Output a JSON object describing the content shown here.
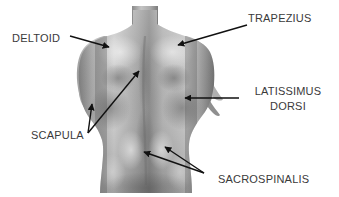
{
  "diagram": {
    "background_color": "#ffffff",
    "label_color": "#3a3a3a",
    "leader_line_color": "#1a1a1a",
    "figure_tones": {
      "highlight": "#e8e8e8",
      "light": "#c8c8c8",
      "mid": "#9a9a9a",
      "shadow": "#6a6a6a",
      "deep_shadow": "#4a4a4a"
    }
  },
  "labels": {
    "deltoid": "DELTOID",
    "trapezius": "TRAPEZIUS",
    "latissimus_line1": "LATISSIMUS",
    "latissimus_line2": "DORSI",
    "scapula": "SCAPULA",
    "sacrospinalis": "SACROSPINALIS"
  },
  "callouts": [
    {
      "name": "deltoid",
      "label": "DELTOID",
      "label_x": 12,
      "label_y": 33,
      "arrow_from": [
        70,
        36
      ],
      "arrow_to": [
        109,
        47
      ]
    },
    {
      "name": "trapezius",
      "label": "TRAPEZIUS",
      "label_x": 248,
      "label_y": 17,
      "arrow_from": [
        247,
        25
      ],
      "arrow_to": [
        178,
        45
      ]
    },
    {
      "name": "latissimus-dorsi",
      "label": "LATISSIMUS DORSI",
      "label_x": 244,
      "label_y": 86,
      "arrow_from": [
        239,
        98
      ],
      "arrow_to": [
        185,
        98
      ]
    },
    {
      "name": "scapula",
      "label": "SCAPULA",
      "label_x": 31,
      "label_y": 130,
      "arrow_from": [
        88,
        133
      ],
      "arrow_to": [
        139,
        71
      ],
      "arrow2_from": [
        88,
        133
      ],
      "arrow2_to": [
        92,
        104
      ]
    },
    {
      "name": "sacrospinalis",
      "label": "SACROSPINALIS",
      "label_x": 218,
      "label_y": 174,
      "arrow_from": [
        204,
        173
      ],
      "arrow_to": [
        144,
        152
      ],
      "arrow2_from": [
        204,
        173
      ],
      "arrow2_to": [
        165,
        147
      ]
    }
  ]
}
